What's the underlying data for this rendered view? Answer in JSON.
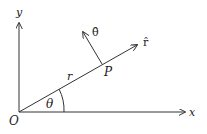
{
  "diagram": {
    "type": "polar-unit-vectors",
    "labels": {
      "y_axis": "y",
      "x_axis": "x",
      "origin": "O",
      "point": "P",
      "radius": "r",
      "angle": "θ",
      "r_hat": "r̂",
      "theta_hat": "θ̂"
    },
    "colors": {
      "stroke": "#333333",
      "text": "#1a1a1a",
      "background": "#ffffff"
    }
  }
}
